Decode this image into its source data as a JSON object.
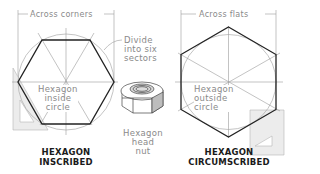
{
  "diagram": {
    "left": {
      "dimension_label": "Across corners",
      "inner_label_lines": [
        "Hexagon",
        "inside",
        "circle"
      ],
      "title_lines": [
        "HEXAGON",
        "INSCRIBED"
      ]
    },
    "middle": {
      "divide_label_lines": [
        "Divide",
        "into six",
        "sectors"
      ],
      "nut_label_lines": [
        "Hexagon",
        "head",
        "nut"
      ]
    },
    "right": {
      "dimension_label": "Across flats",
      "inner_label_lines": [
        "Hexagon",
        "outside",
        "circle"
      ],
      "title_lines": [
        "HEXAGON",
        "CIRCUMSCRIBED"
      ]
    },
    "colors": {
      "hexagon_line": "#222222",
      "construction_line": "#9a9a9a",
      "triangle_fill": "#ececec",
      "label_text": "#8a8a8a",
      "title_text": "#1a1a1a"
    }
  }
}
